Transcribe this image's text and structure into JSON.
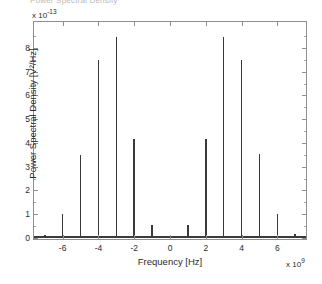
{
  "figure": {
    "clipped_title": "Power Spectral Density",
    "background_color": "#ffffff",
    "line_color": "#3a3a3a",
    "axis_color": "#8f8f8f"
  },
  "axes": {
    "y_axis_label": "Power Spectral Density [V²/Hz]",
    "x_axis_label": "Frequency [Hz]",
    "y_exponent_prefix": "x 10",
    "y_exponent_value": "-13",
    "x_exponent_prefix": "x 10",
    "x_exponent_value": "9",
    "y_tick_labels": [
      "0",
      "1",
      "2",
      "3",
      "4",
      "5",
      "6",
      "7",
      "8"
    ],
    "x_tick_labels": [
      "-6",
      "-4",
      "-2",
      "0",
      "2",
      "4",
      "6"
    ]
  },
  "chart_data": {
    "type": "bar",
    "title": "Power Spectral Density",
    "xlabel": "Frequency [Hz]",
    "ylabel": "Power Spectral Density [V^2/Hz]",
    "x_unit_scale": 1000000000.0,
    "y_unit_scale": 1e-13,
    "xlim": [
      -7.6,
      7.6
    ],
    "ylim": [
      -0.18,
      8.95
    ],
    "x_ticks": [
      -6,
      -4,
      -2,
      0,
      2,
      4,
      6
    ],
    "y_ticks": [
      0,
      1,
      2,
      3,
      4,
      5,
      6,
      7,
      8
    ],
    "grid": false,
    "legend": null,
    "x": [
      -7,
      -6,
      -5,
      -4,
      -3,
      -2,
      -1,
      1,
      2,
      3,
      4,
      5,
      6,
      7
    ],
    "values": [
      0.1,
      0.97,
      3.47,
      7.45,
      8.4,
      4.12,
      0.5,
      0.5,
      4.12,
      8.4,
      7.45,
      3.5,
      0.97,
      0.11
    ],
    "points": [
      {
        "x": -7,
        "y": 0.1
      },
      {
        "x": -6,
        "y": 0.97
      },
      {
        "x": -5,
        "y": 3.47
      },
      {
        "x": -4,
        "y": 7.45
      },
      {
        "x": -3,
        "y": 8.4
      },
      {
        "x": -2,
        "y": 4.12
      },
      {
        "x": -1,
        "y": 0.5
      },
      {
        "x": 1,
        "y": 0.5
      },
      {
        "x": 2,
        "y": 4.12
      },
      {
        "x": 3,
        "y": 8.4
      },
      {
        "x": 4,
        "y": 7.45
      },
      {
        "x": 5,
        "y": 3.5
      },
      {
        "x": 6,
        "y": 0.97
      },
      {
        "x": 7,
        "y": 0.11
      }
    ]
  }
}
